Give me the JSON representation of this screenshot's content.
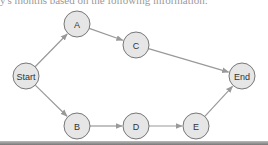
{
  "caption": "y's months based on the following information:",
  "diagram": {
    "nodes": [
      {
        "id": "start",
        "label": "Start",
        "x": 26,
        "y": 76
      },
      {
        "id": "a",
        "label": "A",
        "x": 77,
        "y": 24
      },
      {
        "id": "b",
        "label": "B",
        "x": 77,
        "y": 126
      },
      {
        "id": "c",
        "label": "C",
        "x": 136,
        "y": 45
      },
      {
        "id": "d",
        "label": "D",
        "x": 136,
        "y": 126
      },
      {
        "id": "e",
        "label": "E",
        "x": 196,
        "y": 126
      },
      {
        "id": "end",
        "label": "End",
        "x": 242,
        "y": 76
      }
    ],
    "edges": [
      {
        "from": "start",
        "to": "a"
      },
      {
        "from": "a",
        "to": "c"
      },
      {
        "from": "c",
        "to": "end"
      },
      {
        "from": "start",
        "to": "b"
      },
      {
        "from": "b",
        "to": "d"
      },
      {
        "from": "d",
        "to": "e"
      },
      {
        "from": "e",
        "to": "end"
      }
    ],
    "colors": {
      "node_fill": "#e6e6e6",
      "node_stroke": "#777777",
      "edge": "#999999"
    }
  }
}
